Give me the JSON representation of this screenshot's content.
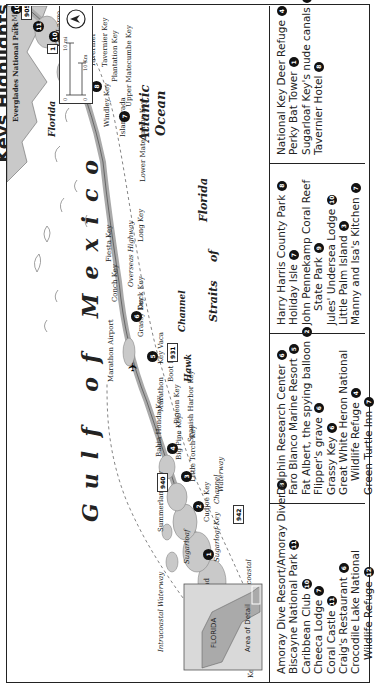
{
  "page_title_fragment": "Keys Highlights",
  "map": {
    "water_labels": {
      "gulf": "Gulf of Mexico",
      "atlantic_line1": "Atlantic",
      "atlantic_line2": "Ocean",
      "straits_1": "Straits",
      "straits_2": "of",
      "straits_3": "Florida",
      "hawk_channel_1": "Hawk",
      "hawk_channel_2": "Channel",
      "florida_bay_1": "Florida",
      "florida_bay_2": "Bay",
      "intracoastal_1": "Intracoastal Waterway",
      "intracoastal_2": "Intracoastal",
      "intracoastal_3": "Waterway"
    },
    "places": [
      "Key West Intl. Airport",
      "Key West",
      "Stock Island",
      "Sugarloaf Key",
      "Sugarloaf",
      "Summerland Key",
      "Cudjoe Key",
      "Channel",
      "Little Torch Key",
      "Big Pine Key",
      "Bahia Honda Key",
      "Spanish Harbor Key",
      "Pigeon Key",
      "Marathon",
      "Boot Key",
      "Key Vaca",
      "Marathon Airport",
      "Grassy Key",
      "Duck Key",
      "Conch Key",
      "Overseas Highway",
      "Fiesta Key",
      "Long Key",
      "Lower Matecumbe Key",
      "Islamorada",
      "Windley Key",
      "Upper Matecumbe Key",
      "Plantation Key",
      "Tavernier",
      "Tavernier Key",
      "Key Largo",
      "Everglades National Park",
      "To Miami"
    ],
    "routes": [
      "905",
      "1",
      "939",
      "940",
      "941",
      "942",
      "931"
    ],
    "markers": [
      {
        "n": "10",
        "pos": "north-top"
      },
      {
        "n": "11",
        "pos": "key-largo-north"
      },
      {
        "n": "10",
        "pos": "key-largo-mid"
      },
      {
        "n": "9",
        "pos": "key-largo"
      },
      {
        "n": "8",
        "pos": "tavernier"
      },
      {
        "n": "7",
        "pos": "islamorada"
      },
      {
        "n": "6",
        "pos": "grassy-key"
      },
      {
        "n": "5",
        "pos": "marathon"
      },
      {
        "n": "4",
        "pos": "big-pine"
      },
      {
        "n": "3",
        "pos": "little-torch"
      },
      {
        "n": "2",
        "pos": "cudjoe"
      },
      {
        "n": "1",
        "pos": "sugarloaf"
      }
    ],
    "scale": {
      "mi_zero": "0",
      "mi_label": "10 mi",
      "km_zero": "0",
      "km_label": "10 Km"
    },
    "inset": {
      "state_label": "FLORIDA",
      "detail_label": "Area of Detail"
    }
  },
  "legend": {
    "columns": [
      [
        {
          "name": "Amoray Dive Resort/Amoray Diver",
          "n": "8"
        },
        {
          "name": "Biscayne National Park",
          "n": "11"
        },
        {
          "name": "Caribbean Club",
          "n": "10"
        },
        {
          "name": "Cheeca Lodge",
          "n": "7"
        },
        {
          "name": "Coral Castle",
          "n": "11"
        },
        {
          "name": "Craig's Restaurant",
          "n": "6"
        },
        {
          "name": "Crocodile Lake National",
          "n": ""
        },
        {
          "name": "Wildlife Refuge",
          "n": "12",
          "indent": true
        }
      ],
      [
        {
          "name": "Dolphin Research Center",
          "n": "6"
        },
        {
          "name": "Faro Blanco Marine Resort",
          "n": "5"
        },
        {
          "name": "Fat Albert, the spying balloon",
          "n": "2"
        },
        {
          "name": "Flipper's grave",
          "n": "6"
        },
        {
          "name": "Grassy Key",
          "n": "6"
        },
        {
          "name": "Great White Heron National",
          "n": ""
        },
        {
          "name": "Wildlife Refuge",
          "n": "4",
          "indent": true
        },
        {
          "name": "Green Turtle Inn",
          "n": "7"
        }
      ],
      [
        {
          "name": "Harry Harris County Park",
          "n": "8"
        },
        {
          "name": "Holiday Isle",
          "n": "7"
        },
        {
          "name": "John Pennekamp Coral Reef",
          "n": ""
        },
        {
          "name": "State Park",
          "n": "9",
          "indent": true
        },
        {
          "name": "Jules' Undersea Lodge",
          "n": "10"
        },
        {
          "name": "Little Palm Island",
          "n": "3"
        },
        {
          "name": "Manny and Isa's Kitchen",
          "n": "7"
        }
      ],
      [
        {
          "name": "National Key Deer Refuge",
          "n": "4"
        },
        {
          "name": "Perky Bat Tower",
          "n": "1"
        },
        {
          "name": "Sugarloaf Key's nude canals",
          "n": "1"
        },
        {
          "name": "Tavernier Hotel",
          "n": "8"
        }
      ]
    ]
  },
  "colors": {
    "land": "#c9c9c9",
    "water": "#ffffff",
    "ink": "#222222",
    "marker": "#111111"
  }
}
